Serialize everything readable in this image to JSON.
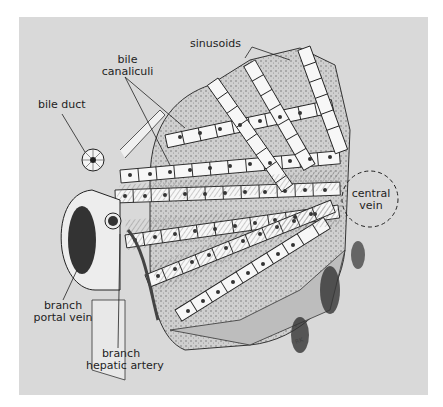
{
  "figure": {
    "background_color": "#d9d9d9",
    "labels": {
      "sinusoids": "sinusoids",
      "bile_canaliculi_line1": "bile",
      "bile_canaliculi_line2": "canaliculi",
      "bile_duct": "bile duct",
      "central_vein_line1": "central",
      "central_vein_line2": "vein",
      "portal_vein_line1": "branch",
      "portal_vein_line2": "portal vein",
      "hepatic_artery_line1": "branch",
      "hepatic_artery_line2": "hepatic artery"
    }
  }
}
